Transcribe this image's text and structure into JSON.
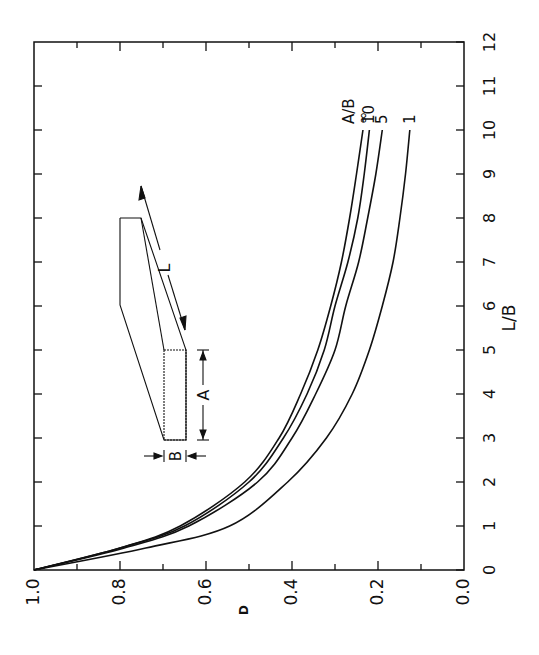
{
  "chart_data": {
    "type": "line",
    "title": "",
    "orientation": "rotated 90 degrees counter-clockwise (x axis L/B runs vertically on right, D axis runs horizontally along bottom)",
    "xlabel": "L/B",
    "ylabel": "D",
    "xlim": [
      0,
      12
    ],
    "ylim": [
      0.0,
      1.0
    ],
    "x_ticks": [
      "0",
      "1",
      "2",
      "3",
      "4",
      "5",
      "6",
      "7",
      "8",
      "9",
      "10",
      "11",
      "12"
    ],
    "y_ticks": [
      "0.0",
      "0.2",
      "0.4",
      "0.6",
      "0.8",
      "1.0"
    ],
    "grid": false,
    "legend_title": "A/B",
    "x": [
      0,
      0.5,
      1,
      2,
      3,
      4,
      5,
      6,
      7,
      8,
      9,
      10
    ],
    "series": [
      {
        "name": "∞",
        "values": [
          1.0,
          0.8,
          0.66,
          0.51,
          0.43,
          0.38,
          0.34,
          0.31,
          0.285,
          0.266,
          0.25,
          0.235
        ]
      },
      {
        "name": "10",
        "values": [
          1.0,
          0.8,
          0.65,
          0.5,
          0.42,
          0.365,
          0.325,
          0.3,
          0.27,
          0.247,
          0.232,
          0.22
        ]
      },
      {
        "name": "5",
        "values": [
          1.0,
          0.79,
          0.64,
          0.48,
          0.4,
          0.345,
          0.3,
          0.275,
          0.245,
          0.224,
          0.205,
          0.19
        ]
      },
      {
        "name": "1",
        "values": [
          1.0,
          0.74,
          0.545,
          0.41,
          0.32,
          0.26,
          0.22,
          0.19,
          0.165,
          0.149,
          0.136,
          0.126
        ]
      }
    ],
    "annotations": {
      "inset": "rectangular bar diagram with dimensions A, B and L",
      "dimension_labels": [
        "A",
        "B",
        "L"
      ]
    }
  },
  "labels": {
    "x_axis_title": "L/B",
    "y_axis_title": "D",
    "legend_title": "A/B",
    "series_labels": [
      "∞",
      "10",
      "5",
      "1"
    ],
    "x_ticks": [
      "0",
      "1",
      "2",
      "3",
      "4",
      "5",
      "6",
      "7",
      "8",
      "9",
      "10",
      "11",
      "12"
    ],
    "y_ticks": [
      "1.0",
      "0.8",
      "0.6",
      "0.4",
      "0.2",
      "0.0"
    ],
    "dim_a": "A",
    "dim_b": "B",
    "dim_l": "L"
  },
  "colors": {
    "ink": "#111111",
    "background": "#ffffff"
  }
}
